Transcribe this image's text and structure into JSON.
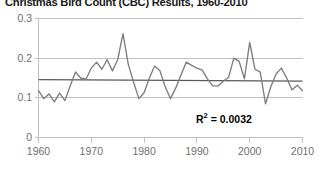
{
  "chart_data": {
    "type": "line",
    "title": "Christmas Bird Count (CBC) Results, 1960-2010",
    "xlabel": "",
    "ylabel": "",
    "xlim": [
      1960,
      2010
    ],
    "ylim": [
      0,
      0.3
    ],
    "grid": true,
    "legend": null,
    "annotations": [
      {
        "text": "R² = 0.0032",
        "r2_label": "R",
        "r2_sup": "2",
        "r2_value": "= 0.0032"
      }
    ],
    "xticks": [
      1960,
      1970,
      1980,
      1990,
      2000,
      2010
    ],
    "xtick_labels": [
      "1960",
      "1970",
      "1980",
      "1990",
      "2000",
      "2010"
    ],
    "yticks": [
      0,
      0.1,
      0.2,
      0.3
    ],
    "ytick_labels": [
      "0",
      "0.1",
      "0.2",
      "0.3"
    ],
    "series": [
      {
        "name": "CBC count",
        "color": "#7d7d7d",
        "x": [
          1960,
          1961,
          1962,
          1963,
          1964,
          1965,
          1966,
          1967,
          1968,
          1969,
          1970,
          1971,
          1972,
          1973,
          1974,
          1975,
          1976,
          1977,
          1978,
          1979,
          1980,
          1981,
          1982,
          1983,
          1984,
          1985,
          1986,
          1987,
          1988,
          1989,
          1990,
          1991,
          1992,
          1993,
          1994,
          1995,
          1996,
          1997,
          1998,
          1999,
          2000,
          2001,
          2002,
          2003,
          2004,
          2005,
          2006,
          2007,
          2008,
          2009,
          2010
        ],
        "values": [
          0.118,
          0.098,
          0.11,
          0.09,
          0.112,
          0.093,
          0.13,
          0.165,
          0.15,
          0.147,
          0.175,
          0.19,
          0.172,
          0.196,
          0.168,
          0.196,
          0.262,
          0.185,
          0.14,
          0.098,
          0.113,
          0.15,
          0.18,
          0.168,
          0.128,
          0.098,
          0.125,
          0.158,
          0.19,
          0.182,
          0.175,
          0.17,
          0.148,
          0.13,
          0.13,
          0.142,
          0.152,
          0.2,
          0.192,
          0.148,
          0.24,
          0.172,
          0.165,
          0.085,
          0.128,
          0.16,
          0.175,
          0.15,
          0.12,
          0.132,
          0.118
        ]
      }
    ],
    "trendline": {
      "name": "linear-trend",
      "color": "#595959",
      "y_start": 0.146,
      "y_end": 0.142,
      "r2": 0.0032
    }
  }
}
